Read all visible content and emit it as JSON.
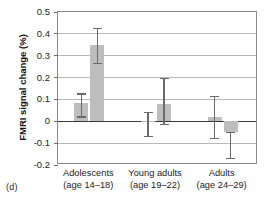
{
  "figure": {
    "panel_label": "(d)",
    "ylabel": "FMRI signal change (%)"
  },
  "chart_data": {
    "type": "bar",
    "title": "",
    "xlabel": "",
    "ylabel": "FMRI signal change (%)",
    "ylim": [
      -0.2,
      0.5
    ],
    "yticks": [
      0.5,
      0.4,
      0.3,
      0.2,
      0.1,
      0,
      -0.1,
      -0.2
    ],
    "ytick_labels": [
      "0.5",
      "0.4",
      "0.3",
      "0.2",
      "0.1",
      "0",
      "-0.1",
      "-0.2"
    ],
    "grid": true,
    "legend": "none",
    "bar_color": "#bdbdbd",
    "errorbar_color": "#6a6a6a",
    "zero_line": 0,
    "categories": [
      "Adolescents\n(age 14–18)",
      "Young adults\n(age 19–22)",
      "Adults\n(age 24–29)"
    ],
    "category_labels": [
      {
        "line1": "Adolescents",
        "line2": "(age 14–18)"
      },
      {
        "line1": "Young adults",
        "line2": "(age 19–22)"
      },
      {
        "line1": "Adults",
        "line2": "(age 24–29)"
      }
    ],
    "series": [
      {
        "name": "Condition 1",
        "values": [
          0.085,
          0.0,
          0.02
        ],
        "err_low": [
          0.02,
          -0.07,
          -0.08
        ],
        "err_high": [
          0.125,
          0.04,
          0.115
        ]
      },
      {
        "name": "Condition 2",
        "values": [
          0.35,
          0.08,
          -0.05
        ],
        "err_low": [
          0.265,
          -0.015,
          -0.17
        ],
        "err_high": [
          0.425,
          0.195,
          -0.05
        ]
      }
    ]
  }
}
